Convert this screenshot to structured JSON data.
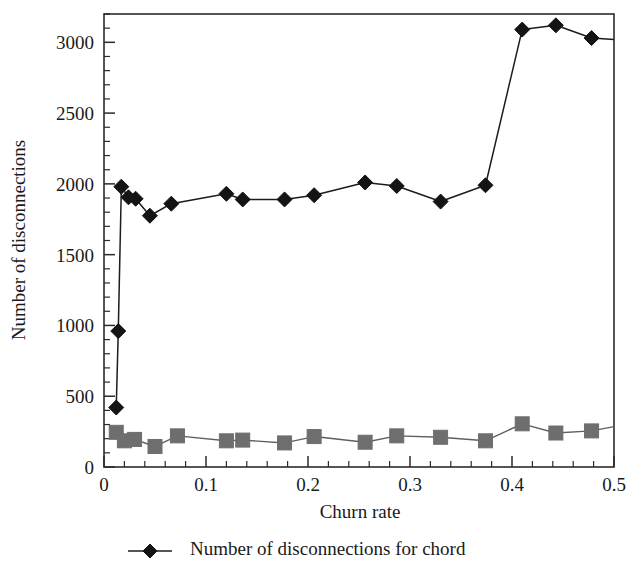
{
  "chart_data": {
    "type": "line",
    "title": "",
    "xlabel": "Churn rate",
    "ylabel": "Number of disconnections",
    "xlim": [
      0,
      0.5
    ],
    "ylim": [
      0,
      3200
    ],
    "grid": false,
    "legend_position": "bottom",
    "x_ticks": [
      0,
      0.1,
      0.2,
      0.3,
      0.4,
      0.5
    ],
    "x_tick_labels": [
      "0",
      "0.1",
      "0.2",
      "0.3",
      "0.4",
      "0.5"
    ],
    "x_minor_step": 0.02,
    "y_ticks": [
      0,
      500,
      1000,
      1500,
      2000,
      2500,
      3000
    ],
    "y_tick_labels": [
      "0",
      "500",
      "1000",
      "1500",
      "2000",
      "2500",
      "3000"
    ],
    "y_minor_step": 100,
    "series": [
      {
        "name": "Number of disconnections for chord",
        "marker": "diamond",
        "color": "#141414",
        "x": [
          0.012,
          0.014,
          0.017,
          0.024,
          0.031,
          0.045,
          0.066,
          0.12,
          0.136,
          0.177,
          0.206,
          0.256,
          0.287,
          0.33,
          0.374,
          0.41,
          0.443,
          0.478,
          0.5
        ],
        "values": [
          420,
          960,
          1980,
          1905,
          1895,
          1775,
          1860,
          1930,
          1890,
          1890,
          1920,
          2010,
          1985,
          1875,
          1990,
          3090,
          3120,
          3030,
          3020
        ]
      },
      {
        "name": "series-2",
        "marker": "square",
        "color": "#6e6e6e",
        "x": [
          0.012,
          0.02,
          0.03,
          0.05,
          0.072,
          0.12,
          0.136,
          0.177,
          0.206,
          0.256,
          0.287,
          0.33,
          0.374,
          0.41,
          0.443,
          0.478,
          0.5
        ],
        "values": [
          245,
          185,
          195,
          145,
          220,
          185,
          190,
          170,
          215,
          175,
          220,
          210,
          185,
          305,
          240,
          255,
          285
        ]
      }
    ]
  },
  "legend": {
    "entries": [
      {
        "label": "Number of disconnections for chord",
        "marker": "diamond",
        "color": "#141414"
      }
    ]
  },
  "colors": {
    "chord_series": "#141414",
    "second_series": "#6e6e6e",
    "axis": "#2b2b2b",
    "background": "#ffffff"
  }
}
